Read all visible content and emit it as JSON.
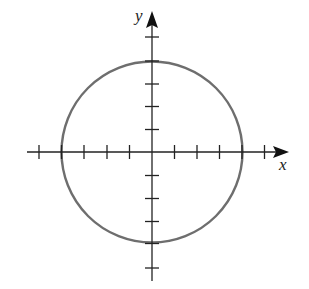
{
  "diagram": {
    "type": "circle-on-axes",
    "x_axis_label": "x",
    "y_axis_label": "y",
    "origin": [
      0,
      0
    ],
    "circle": {
      "center": [
        0,
        0
      ],
      "radius": 4,
      "stroke": "#6e6e6e"
    },
    "tick_marks": {
      "x": [
        -5,
        -4,
        -3,
        -2,
        -1,
        1,
        2,
        3,
        4,
        5
      ],
      "y": [
        -5,
        -4,
        -3,
        -2,
        -1,
        1,
        2,
        3,
        4,
        5
      ]
    },
    "axis_color": "#222222"
  }
}
